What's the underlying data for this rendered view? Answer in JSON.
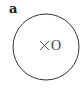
{
  "figure": {
    "panel_label": "a",
    "circle": {
      "cx": 46,
      "cy": 47,
      "r": 33,
      "stroke": "#333333"
    },
    "marker": {
      "symbol": "×",
      "label": "O",
      "color": "#444444"
    }
  }
}
